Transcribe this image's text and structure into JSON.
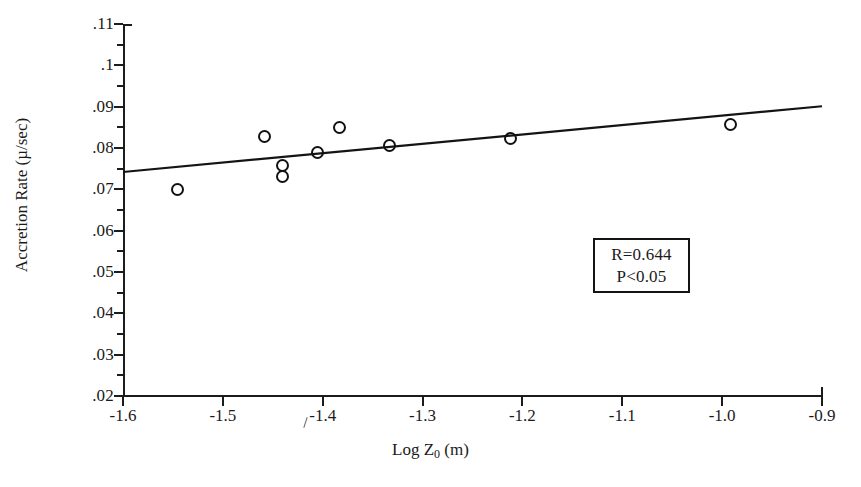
{
  "chart_data": {
    "type": "scatter",
    "title": "",
    "xlabel": "Log Z0 (m)",
    "xlabel_base": "Log Z",
    "xlabel_sub": "0",
    "xlabel_unit": " (m)",
    "ylabel": "Accretion Rate (µ/sec)",
    "xlim": [
      -1.6,
      -0.9
    ],
    "ylim": [
      0.02,
      0.11
    ],
    "grid": false,
    "legend": "none",
    "x_tick_labels": [
      "-1.6",
      "-1.5",
      "-1.4",
      "-1.3",
      "-1.2",
      "-1.1",
      "-1.0",
      "-0.9"
    ],
    "x_tick_values": [
      -1.6,
      -1.5,
      -1.4,
      -1.3,
      -1.2,
      -1.1,
      -1.0,
      -0.9
    ],
    "y_tick_labels": [
      ".11",
      ".1",
      ".09",
      ".08",
      ".07",
      ".06",
      ".05",
      ".04",
      ".03",
      ".02"
    ],
    "y_tick_values": [
      0.11,
      0.1,
      0.09,
      0.08,
      0.07,
      0.06,
      0.05,
      0.04,
      0.03,
      0.02
    ],
    "y_minor_tick_values": [
      0.105,
      0.095,
      0.085,
      0.075,
      0.065,
      0.055,
      0.045,
      0.035,
      0.025
    ],
    "points": [
      {
        "x": -1.545,
        "y": 0.07
      },
      {
        "x": -1.458,
        "y": 0.0828
      },
      {
        "x": -1.44,
        "y": 0.0758
      },
      {
        "x": -1.44,
        "y": 0.0731
      },
      {
        "x": -1.405,
        "y": 0.0789
      },
      {
        "x": -1.383,
        "y": 0.0849
      },
      {
        "x": -1.333,
        "y": 0.0806
      },
      {
        "x": -1.212,
        "y": 0.0823
      },
      {
        "x": -0.992,
        "y": 0.0857
      }
    ],
    "trendline": {
      "x_start": -1.6,
      "y_start": 0.0742,
      "x_end": -0.9,
      "y_end": 0.0901
    },
    "annotations": [
      {
        "name": "stats-box",
        "lines": [
          "R=0.644",
          "P<0.05"
        ]
      }
    ],
    "colors": {
      "axis": "#1c1c1c",
      "marker_stroke": "#111111",
      "trendline": "#141414",
      "background": "#ffffff",
      "text": "#1a1a1a"
    }
  },
  "stats": {
    "r_label": "R=0.644",
    "p_label": "P<0.05"
  }
}
